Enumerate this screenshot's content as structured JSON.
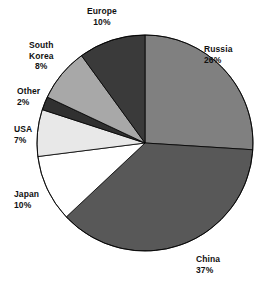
{
  "chart_data": {
    "type": "pie",
    "title": "",
    "subtitle": "",
    "xlabel": "",
    "ylabel": "",
    "legend_position": "none",
    "grid": false,
    "start_angle_deg": 0,
    "direction": "clockwise",
    "units": "percent",
    "categories": [
      "Russia",
      "China",
      "Japan",
      "USA",
      "Other",
      "South Korea",
      "Europe"
    ],
    "values": [
      26,
      37,
      10,
      7,
      2,
      8,
      10
    ],
    "slices": [
      {
        "label": "Russia",
        "value": 26,
        "value_text": "26%",
        "color": "#808080",
        "label_lines": [
          "Russia",
          "26%"
        ],
        "label_x": 204,
        "label_y": 44,
        "align": "left"
      },
      {
        "label": "China",
        "value": 37,
        "value_text": "37%",
        "color": "#585858",
        "label_lines": [
          "China",
          "37%"
        ],
        "label_x": 196,
        "label_y": 254,
        "align": "left"
      },
      {
        "label": "Japan",
        "value": 10,
        "value_text": "10%",
        "color": "#ffffff",
        "label_lines": [
          "Japan",
          "10%"
        ],
        "label_x": 14,
        "label_y": 189,
        "align": "left"
      },
      {
        "label": "USA",
        "value": 7,
        "value_text": "7%",
        "color": "#e8e8e8",
        "label_lines": [
          "USA",
          "7%"
        ],
        "label_x": 14,
        "label_y": 124,
        "align": "left"
      },
      {
        "label": "Other",
        "value": 2,
        "value_text": "2%",
        "color": "#303030",
        "label_lines": [
          "Other",
          "2%"
        ],
        "label_x": 17,
        "label_y": 86,
        "align": "left"
      },
      {
        "label": "South Korea",
        "value": 8,
        "value_text": "8%",
        "color": "#a8a8a8",
        "label_lines": [
          "South",
          "Korea",
          "8%"
        ],
        "label_x": 29,
        "label_y": 40,
        "align": "center"
      },
      {
        "label": "Europe",
        "value": 10,
        "value_text": "10%",
        "color": "#3a3a3a",
        "label_lines": [
          "Europe",
          "10%"
        ],
        "label_x": 87,
        "label_y": 6,
        "align": "center"
      }
    ],
    "geometry": {
      "center_x": 145,
      "center_y": 143,
      "radius": 108,
      "stroke_color": "#000000",
      "stroke_width": 0.8
    },
    "background_color": "#ffffff"
  }
}
